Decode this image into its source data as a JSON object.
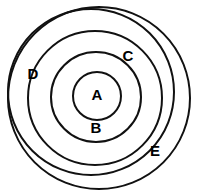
{
  "diagram": {
    "type": "nested-circles",
    "background_color": "#ffffff",
    "stroke_color": "#111111",
    "label_color": "#000000",
    "canvas": {
      "width": 199,
      "height": 195
    },
    "sets": [
      {
        "id": "A",
        "label": "A",
        "level": 1,
        "center_x": 97,
        "center_y": 96,
        "radius": 24,
        "stroke_width": 2.0,
        "label_x": 97,
        "label_y": 96
      },
      {
        "id": "B",
        "label": "B",
        "level": 2,
        "center_x": 96,
        "center_y": 97,
        "radius": 45,
        "stroke_width": 2.0,
        "label_x": 96,
        "label_y": 129
      },
      {
        "id": "C",
        "label": "C",
        "level": 3,
        "center_x": 95,
        "center_y": 98,
        "radius": 67,
        "stroke_width": 2.0,
        "label_x": 128,
        "label_y": 57
      },
      {
        "id": "D",
        "label": "D",
        "level": 4,
        "center_x": 91,
        "center_y": 92,
        "radius": 83,
        "stroke_width": 2.0,
        "label_x": 33,
        "label_y": 75
      },
      {
        "id": "E",
        "label": "E",
        "level": 5,
        "center_x": 99,
        "center_y": 98,
        "radius": 91,
        "stroke_width": 2.0,
        "label_x": 155,
        "label_y": 152
      }
    ],
    "label_font_size": 15
  }
}
